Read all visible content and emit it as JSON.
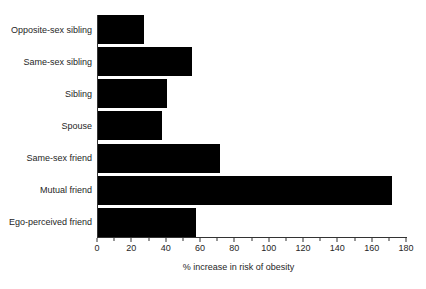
{
  "chart_data": {
    "type": "bar",
    "orientation": "horizontal",
    "categories": [
      "Opposite-sex sibling",
      "Same-sex sibling",
      "Sibling",
      "Spouse",
      "Same-sex friend",
      "Mutual friend",
      "Ego-perceived friend"
    ],
    "values": [
      27,
      55,
      40,
      37,
      71,
      171,
      57
    ],
    "xlabel": "% increase in risk of obesity",
    "xlim": [
      0,
      180
    ],
    "x_major_ticks": [
      0,
      20,
      40,
      60,
      80,
      100,
      120,
      140,
      160,
      180
    ],
    "x_minor_tick_step": 10,
    "grid": false,
    "legend": false,
    "bar_color": "#000000",
    "axis_color": "#333333",
    "text_color": "#262626",
    "background_color": "#ffffff"
  }
}
